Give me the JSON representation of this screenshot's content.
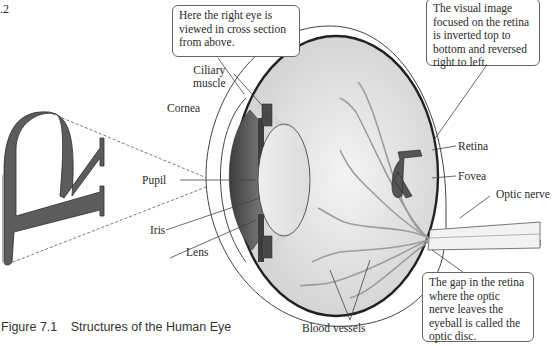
{
  "page_number_fragment": ".2",
  "figure": {
    "number": "Figure 7.1",
    "title": "Structures of the Human Eye"
  },
  "callouts": {
    "cross_section": "Here the right eye is viewed in cross section from above.",
    "inverted_image": "The visual image focused on the retina is inverted top to bottom and reversed right to left.",
    "optic_disc": "The gap in the retina where the optic nerve leaves the eyeball is called the optic disc."
  },
  "labels": {
    "ciliary_muscle_line1": "Ciliary",
    "ciliary_muscle_line2": "muscle",
    "cornea": "Cornea",
    "pupil": "Pupil",
    "iris": "Iris",
    "lens": "Lens",
    "retina": "Retina",
    "fovea": "Fovea",
    "optic_nerve": "Optic nerve",
    "blood_vessels": "Blood vessels"
  },
  "object_letter": "R",
  "colors": {
    "letter_fill": "#5a5a5a",
    "eye_interior": "#e6e6e6",
    "iris_dark": "#4a4a4a",
    "sclera_line": "#3a3a3a",
    "vessel": "#9a9a9a"
  }
}
